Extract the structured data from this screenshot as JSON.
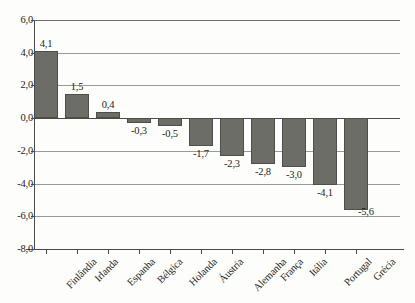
{
  "chart_data": {
    "type": "bar",
    "title": "",
    "subtitle": "",
    "xlabel": "",
    "ylabel": "",
    "ylim": [
      -8.0,
      6.0
    ],
    "ytick_step": 2.0,
    "grid": true,
    "legend": false,
    "decimal_separator": ",",
    "bar_color": "#6d6d68",
    "bar_border_color": "#4f4f4a",
    "grid_color": "#9a9a94",
    "axis_color": "#4a4a46",
    "yticks": [
      "6,0",
      "4,0",
      "2,0",
      "0,0",
      "-2,0",
      "-4,0",
      "-6,0",
      "-8,0"
    ],
    "ytick_values": [
      6.0,
      4.0,
      2.0,
      0.0,
      -2.0,
      -4.0,
      -6.0,
      -8.0
    ],
    "categories": [
      "Finlândia",
      "Irlanda",
      "Espanha",
      "Bélgica",
      "Holanda",
      "Áustria",
      "Alemanha",
      "França",
      "Itália",
      "Portugal",
      "Grécia"
    ],
    "values": [
      4.1,
      1.5,
      0.4,
      -0.3,
      -0.5,
      -1.7,
      -2.3,
      -2.8,
      -3.0,
      -4.1,
      -5.6
    ],
    "value_labels": [
      "4,1",
      "1,5",
      "0,4",
      "-0,3",
      "-0,5",
      "-1,7",
      "-2,3",
      "-2,8",
      "-3,0",
      "-4,1",
      "-5,6"
    ]
  }
}
